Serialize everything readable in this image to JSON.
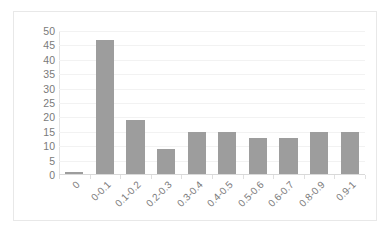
{
  "chart_data": {
    "type": "bar",
    "title": "",
    "subtitle": "",
    "xlabel": "",
    "ylabel": "",
    "categories": [
      "0",
      "0-0.1",
      "0.1-0.2",
      "0.2-0.3",
      "0.3-0.4",
      "0.4-0.5",
      "0.5-0.6",
      "0.6-0.7",
      "0.8-0.9",
      "0.9-1"
    ],
    "values": [
      1,
      47,
      19,
      9,
      15,
      15,
      13,
      13,
      15,
      15
    ],
    "ylim": [
      0,
      50
    ],
    "ytick_labels": [
      "50",
      "45",
      "40",
      "35",
      "30",
      "25",
      "20",
      "15",
      "10",
      "5",
      "0"
    ],
    "ytick_values": [
      50,
      45,
      40,
      35,
      30,
      25,
      20,
      15,
      10,
      5,
      0
    ],
    "ytick_step": 5,
    "grid": true,
    "legend": false,
    "legend_position": "none",
    "bar_color": "#9d9d9d",
    "gridline_color": "#f2f2f2",
    "axis_color": "#d9d9d9",
    "tick_label_color": "#7a7a7a",
    "plot_background": "#ffffff",
    "xtick_rotation_degrees": -45
  }
}
